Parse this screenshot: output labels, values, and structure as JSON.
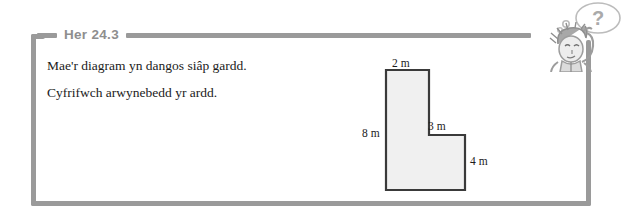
{
  "exercise": {
    "heading": "Her 24.3",
    "lines": [
      "Mae'r diagram yn dangos siâp gardd.",
      "Cyfrifwch arwynebedd yr ardd."
    ]
  },
  "diagram": {
    "shape_name": "L-shaped garden",
    "labels": {
      "top": "2 m",
      "left": "8 m",
      "middle": "3 m",
      "right": "4 m"
    },
    "colors": {
      "fill": "#f0f0f0",
      "stroke": "#3a3a3a"
    }
  },
  "character": {
    "thought_bubble_text": "?"
  },
  "theme": {
    "frame_color": "#9a9a9a",
    "heading_color": "#8e8e8e",
    "text_color": "#1b1b1b"
  }
}
